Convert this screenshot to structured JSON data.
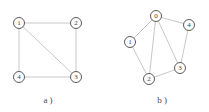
{
  "figure": {
    "width": 209,
    "height": 112,
    "background": "#ffffff",
    "edge_color": "#c8c8c8",
    "node_stroke_color": "#5a5a5a",
    "node_fill_color": "#ffffff",
    "label_color": "#3a3a3a",
    "caption_color": "#4a4a4a",
    "node_radius": 5.5
  },
  "chart_data": {
    "type": "diagram",
    "title": "",
    "subtitle": "",
    "xlabel": "",
    "ylabel": "",
    "grid": false,
    "legend": null,
    "graphs": [
      {
        "id": "graph-a",
        "caption": "a )",
        "caption_x": 48,
        "caption_y": 103,
        "layout": "square-with-diagonal",
        "node_count": 4,
        "edge_count": 5,
        "nodes": [
          {
            "id": "1",
            "label": "1",
            "x": 19,
            "y": 23
          },
          {
            "id": "2",
            "label": "2",
            "x": 76,
            "y": 23
          },
          {
            "id": "3",
            "label": "3",
            "x": 76,
            "y": 77
          },
          {
            "id": "4",
            "label": "4",
            "x": 19,
            "y": 77
          }
        ],
        "edges": [
          {
            "from": "1",
            "to": "2"
          },
          {
            "from": "2",
            "to": "3"
          },
          {
            "from": "3",
            "to": "4"
          },
          {
            "from": "4",
            "to": "1"
          },
          {
            "from": "1",
            "to": "3"
          }
        ]
      },
      {
        "id": "graph-b",
        "caption": "b )",
        "caption_x": 162,
        "caption_y": 103,
        "layout": "pentagon-with-hub",
        "node_count": 5,
        "edge_count": 7,
        "nodes": [
          {
            "id": "0",
            "label": "0",
            "x": 156,
            "y": 16
          },
          {
            "id": "4",
            "label": "4",
            "x": 189,
            "y": 25
          },
          {
            "id": "1",
            "label": "1",
            "x": 130,
            "y": 42
          },
          {
            "id": "3",
            "label": "3",
            "x": 180,
            "y": 68
          },
          {
            "id": "2",
            "label": "2",
            "x": 149,
            "y": 79
          }
        ],
        "edges": [
          {
            "from": "0",
            "to": "1"
          },
          {
            "from": "0",
            "to": "2"
          },
          {
            "from": "0",
            "to": "3"
          },
          {
            "from": "0",
            "to": "4"
          },
          {
            "from": "1",
            "to": "2"
          },
          {
            "from": "2",
            "to": "3"
          },
          {
            "from": "3",
            "to": "4"
          }
        ]
      }
    ]
  }
}
